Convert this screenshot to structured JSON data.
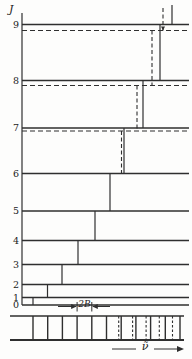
{
  "figure": {
    "axis_label": "J",
    "spacing_label": "2B",
    "wavenumber_label": "ν̃"
  },
  "diagram": {
    "line_color": "#2f2f2f",
    "axis": {
      "x": 22,
      "y1": 13,
      "y2": 305
    },
    "level_x1": 22,
    "level_x2": 189,
    "levels": [
      {
        "j": "0",
        "y": 305
      },
      {
        "j": "1",
        "y": 297.5
      },
      {
        "j": "2",
        "y": 284.5
      },
      {
        "j": "3",
        "y": 264.5
      },
      {
        "j": "4",
        "y": 240.5
      },
      {
        "j": "5",
        "y": 211
      },
      {
        "j": "6",
        "y": 173.5
      },
      {
        "j": "7",
        "y": 128,
        "y_dashed": 131
      },
      {
        "j": "8",
        "y": 80.5,
        "y_dashed": 85.5
      },
      {
        "j": "9",
        "y": 24.5,
        "y_dashed": 30.5
      }
    ],
    "transitions_solid": [
      {
        "name": "0-1",
        "x": 33,
        "y1": 297.5,
        "y2": 305
      },
      {
        "name": "1-2",
        "x": 47.5,
        "y1": 284.5,
        "y2": 297.5
      },
      {
        "name": "2-3",
        "x": 62,
        "y1": 264.5,
        "y2": 284.5
      },
      {
        "name": "3-4",
        "x": 78,
        "y1": 240.5,
        "y2": 264.5
      },
      {
        "name": "4-5",
        "x": 95,
        "y1": 211,
        "y2": 240.5
      },
      {
        "name": "5-6",
        "x": 110,
        "y1": 173.5,
        "y2": 211
      },
      {
        "name": "6-7",
        "x": 124,
        "y1": 128,
        "y2": 173.5
      },
      {
        "name": "7-8",
        "x": 143,
        "y1": 80.5,
        "y2": 128
      },
      {
        "name": "8-9",
        "x": 160,
        "y1": 24.5,
        "y2": 80.5
      },
      {
        "name": "9-10",
        "x": 172,
        "y1": 5,
        "y2": 24.5
      }
    ],
    "transitions_dashed": [
      {
        "name": "6-7",
        "x": 121.5,
        "y1": 131,
        "y2": 173.5
      },
      {
        "name": "7-8",
        "x": 137,
        "y1": 85.5,
        "y2": 131
      },
      {
        "name": "8-9",
        "x": 152,
        "y1": 30.5,
        "y2": 85.5
      },
      {
        "name": "9-10",
        "x": 163,
        "y1": 8,
        "y2": 30.5,
        "arrow_down": true
      }
    ]
  },
  "spectrum": {
    "band": {
      "x1": 10,
      "x2": 184,
      "top": 316,
      "bottom": 340
    },
    "solid_lines_x": [
      33,
      47.7,
      62.4,
      77.1,
      91.8,
      106.5,
      121.2,
      135.9,
      150.6,
      165.3,
      180
    ],
    "dashed_lines_x": [
      118.7,
      132.6,
      146.1,
      159.3,
      172.5
    ],
    "spacing_annotation": {
      "bar1_x": 77.1,
      "bar2_x": 91.8,
      "bar_y1": 302,
      "bar_y2": 311.5,
      "arrow_y": 306.5,
      "left_tail_x": 58,
      "right_tail_x": 110
    },
    "axis_arrow": {
      "y": 349,
      "seg1": [
        112,
        136
      ],
      "seg2": [
        154,
        178
      ],
      "head_tip_x": 184
    }
  }
}
